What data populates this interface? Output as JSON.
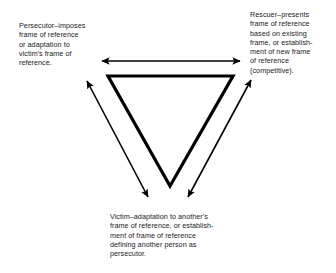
{
  "diagram": {
    "stroke_color": "#000000",
    "background_color": "#ffffff",
    "triangle": {
      "orientation": "inverted",
      "stroke_width": 3.2,
      "vertices": [
        {
          "role": "persecutor",
          "x": 108,
          "y": 76
        },
        {
          "role": "rescuer",
          "x": 233,
          "y": 76
        },
        {
          "role": "victim",
          "x": 170,
          "y": 186
        }
      ]
    },
    "arrows": [
      {
        "name": "persecutor-rescuer-arrow",
        "direction": "double-headed",
        "from": {
          "x": 102,
          "y": 61
        },
        "to": {
          "x": 240,
          "y": 61
        },
        "stroke_width": 1.6
      },
      {
        "name": "victim-persecutor-arrow",
        "direction": "double-headed",
        "from": {
          "x": 148,
          "y": 197
        },
        "to": {
          "x": 87,
          "y": 81
        },
        "stroke_width": 1.6
      },
      {
        "name": "victim-rescuer-arrow",
        "direction": "double-headed",
        "from": {
          "x": 188,
          "y": 197
        },
        "to": {
          "x": 251,
          "y": 80
        },
        "stroke_width": 1.6
      }
    ],
    "captions": {
      "persecutor": "Persecutor–imposes\nframe of reference\nor adaptation to\nvictim's frame of\nreference.",
      "rescuer": "Rescuer–presents\nframe of reference\nbased on existing\nframe, or establish-\nment of new frame\nof reference\n(competitive).",
      "victim": "Victim–adaptation to another's\nframe of reference, or establish-\nment of frame of reference\ndefining another person as\npersecutor."
    }
  }
}
